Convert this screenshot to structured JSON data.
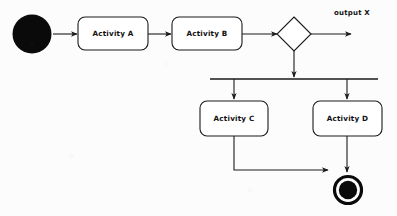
{
  "diagram": {
    "type": "uml-activity-diagram",
    "background_color": "#fcfcfc",
    "line_color": "#1a1a1a",
    "node_fill_color": "#ffffff",
    "terminal_fill_color": "#0a0a0a",
    "nodes": {
      "initial": {
        "kind": "initial-node",
        "label": ""
      },
      "activity_a": {
        "kind": "activity",
        "label": "Activity A"
      },
      "activity_b": {
        "kind": "activity",
        "label": "Activity B"
      },
      "decision": {
        "kind": "decision-node",
        "label": ""
      },
      "fork": {
        "kind": "fork-bar",
        "label": ""
      },
      "activity_c": {
        "kind": "activity",
        "label": "Activity C"
      },
      "activity_d": {
        "kind": "activity",
        "label": "Activity D"
      },
      "final": {
        "kind": "final-node",
        "label": ""
      }
    },
    "edges": {
      "output_x_label": "output X"
    }
  }
}
